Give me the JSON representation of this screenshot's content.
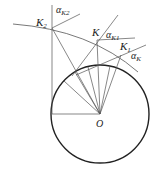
{
  "labels": {
    "k2": "K",
    "k2_sub": "2",
    "k": "K",
    "k1": "K",
    "k1_sub": "1",
    "o": "O",
    "alpha_k2": "α",
    "alpha_k2_sub": "K2",
    "alpha_k1": "α",
    "alpha_k1_sub": "K1",
    "alpha_k": "α",
    "alpha_k_sub": "K"
  },
  "colors": {
    "line": "#555555",
    "circle": "#222222"
  }
}
